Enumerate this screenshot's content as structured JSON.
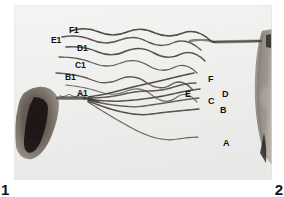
{
  "figure": {
    "kind": "grayscale-micrograph",
    "background_color": "#ffffff",
    "plate_color": "#f2f2f1",
    "ink_color": "#111111"
  },
  "panel_numbers": [
    {
      "name": "panel-number-1",
      "text": "1",
      "corner": "bottom-left"
    },
    {
      "name": "panel-number-2",
      "text": "2",
      "corner": "bottom-right"
    }
  ],
  "labels": {
    "upper_group": [
      {
        "text": "F1",
        "x": 55,
        "y": 21
      },
      {
        "text": "E1",
        "x": 37,
        "y": 31
      },
      {
        "text": "D1",
        "x": 63,
        "y": 39
      },
      {
        "text": "C1",
        "x": 61,
        "y": 56
      },
      {
        "text": "B1",
        "x": 51,
        "y": 68
      },
      {
        "text": "A1",
        "x": 63,
        "y": 84
      }
    ],
    "lower_group": [
      {
        "text": "F",
        "x": 194,
        "y": 70
      },
      {
        "text": "E",
        "x": 171,
        "y": 85
      },
      {
        "text": "D",
        "x": 208,
        "y": 85
      },
      {
        "text": "C",
        "x": 194,
        "y": 92
      },
      {
        "text": "B",
        "x": 206,
        "y": 101
      },
      {
        "text": "A",
        "x": 209,
        "y": 134
      }
    ]
  },
  "specimens": [
    {
      "name": "left-specimen-mass",
      "position": "lower-left",
      "tone": "dark-brown-black"
    },
    {
      "name": "right-specimen-mass",
      "position": "right-edge",
      "tone": "mid-grey-brown"
    }
  ]
}
